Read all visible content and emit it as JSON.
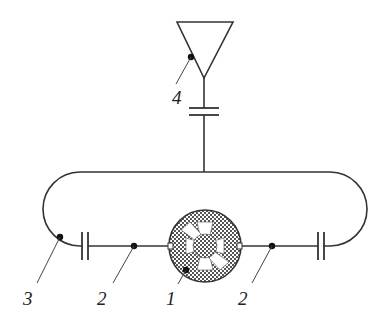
{
  "diagram": {
    "type": "antenna-loop-circuit",
    "colors": {
      "line": "#333333",
      "background": "#ffffff",
      "hatch": "#555555"
    },
    "components": [
      {
        "id": "1",
        "label": "1",
        "description": "rotary element (circular hatched disc with six spokes)"
      },
      {
        "id": "2a",
        "label": "2",
        "description": "left conductor segment"
      },
      {
        "id": "2b",
        "label": "2",
        "description": "right conductor segment"
      },
      {
        "id": "3",
        "label": "3",
        "description": "loop conductor"
      },
      {
        "id": "4",
        "label": "4",
        "description": "triangular antenna element"
      }
    ],
    "capacitors": [
      {
        "name": "top-capacitor"
      },
      {
        "name": "left-capacitor"
      },
      {
        "name": "right-capacitor"
      }
    ]
  },
  "labels": {
    "l1": "1",
    "l2a": "2",
    "l2b": "2",
    "l3": "3",
    "l4": "4"
  }
}
